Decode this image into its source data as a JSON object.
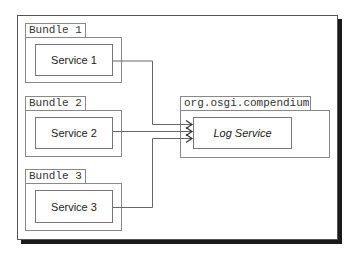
{
  "bundles": [
    {
      "label": "Bundle 1",
      "service": "Service 1"
    },
    {
      "label": "Bundle 2",
      "service": "Service 2"
    },
    {
      "label": "Bundle 3",
      "service": "Service 3"
    }
  ],
  "provider": {
    "label": "org.osgi.compendium",
    "service": "Log Service"
  },
  "colors": {
    "line": "#666666",
    "shadow": "#1a1a1a"
  }
}
